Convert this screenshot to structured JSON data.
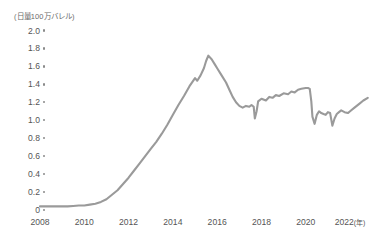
{
  "chart_data": {
    "type": "line",
    "title": "",
    "unit_label": "(日量100万バレル)",
    "xlabel": "",
    "ylabel": "",
    "x_axis_suffix": "(年)",
    "grid": false,
    "legend": false,
    "line_color": "#9a9a9a",
    "xlim": [
      2008.0,
      2022.9
    ],
    "ylim": [
      0,
      2.0
    ],
    "y_ticks": [
      "2.0",
      "1.8",
      "1.6",
      "1.4",
      "1.2",
      "1.0",
      "0.8",
      "0.6",
      "0.4",
      "0.2",
      "0"
    ],
    "y_tick_values": [
      2.0,
      1.8,
      1.6,
      1.4,
      1.2,
      1.0,
      0.8,
      0.6,
      0.4,
      0.2,
      0.0
    ],
    "x_ticks": [
      "2008",
      "2010",
      "2012",
      "2014",
      "2016",
      "2018",
      "2020",
      "2022"
    ],
    "x_tick_values": [
      2008,
      2010,
      2012,
      2014,
      2016,
      2018,
      2020,
      2022
    ],
    "series": [
      {
        "name": "米国シェールオイル生産量",
        "x": [
          2008.0,
          2008.25,
          2008.5,
          2008.75,
          2009.0,
          2009.25,
          2009.5,
          2009.75,
          2010.0,
          2010.25,
          2010.5,
          2010.75,
          2011.0,
          2011.25,
          2011.5,
          2011.75,
          2012.0,
          2012.25,
          2012.5,
          2012.75,
          2013.0,
          2013.25,
          2013.5,
          2013.75,
          2014.0,
          2014.25,
          2014.5,
          2014.75,
          2015.0,
          2015.1,
          2015.25,
          2015.4,
          2015.5,
          2015.6,
          2015.75,
          2015.9,
          2016.0,
          2016.2,
          2016.4,
          2016.55,
          2016.7,
          2016.85,
          2017.0,
          2017.15,
          2017.3,
          2017.45,
          2017.55,
          2017.65,
          2017.7,
          2017.78,
          2017.85,
          2018.0,
          2018.2,
          2018.35,
          2018.5,
          2018.65,
          2018.8,
          2019.0,
          2019.2,
          2019.35,
          2019.5,
          2019.65,
          2019.8,
          2020.0,
          2020.1,
          2020.18,
          2020.25,
          2020.3,
          2020.4,
          2020.5,
          2020.6,
          2020.7,
          2020.8,
          2020.9,
          2021.0,
          2021.1,
          2021.2,
          2021.3,
          2021.4,
          2021.5,
          2021.6,
          2021.75,
          2021.9,
          2022.0,
          2022.2,
          2022.4,
          2022.6,
          2022.8
        ],
        "y": [
          0.04,
          0.04,
          0.04,
          0.04,
          0.04,
          0.04,
          0.045,
          0.05,
          0.05,
          0.06,
          0.07,
          0.09,
          0.12,
          0.17,
          0.22,
          0.29,
          0.36,
          0.44,
          0.52,
          0.6,
          0.68,
          0.76,
          0.85,
          0.95,
          1.06,
          1.17,
          1.27,
          1.38,
          1.47,
          1.44,
          1.5,
          1.58,
          1.66,
          1.72,
          1.68,
          1.62,
          1.58,
          1.5,
          1.42,
          1.34,
          1.26,
          1.2,
          1.16,
          1.14,
          1.16,
          1.15,
          1.17,
          1.15,
          1.02,
          1.1,
          1.21,
          1.24,
          1.22,
          1.26,
          1.25,
          1.28,
          1.27,
          1.3,
          1.29,
          1.32,
          1.31,
          1.34,
          1.35,
          1.36,
          1.36,
          1.35,
          1.21,
          1.04,
          0.96,
          1.06,
          1.1,
          1.08,
          1.07,
          1.06,
          1.09,
          1.08,
          0.94,
          1.02,
          1.07,
          1.09,
          1.11,
          1.09,
          1.08,
          1.1,
          1.14,
          1.18,
          1.22,
          1.25
        ]
      }
    ]
  }
}
